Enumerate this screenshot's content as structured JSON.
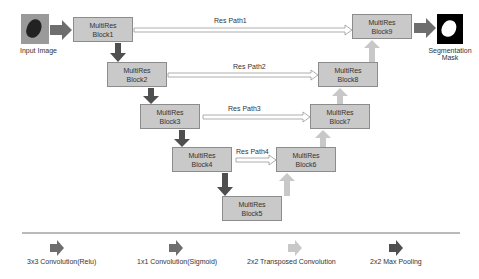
{
  "input": {
    "label": "Input Image"
  },
  "output": {
    "label_line1": "Segmentation",
    "label_line2": "Mask"
  },
  "blocks": [
    {
      "id": "block1",
      "line1": "MultiRes",
      "line2": "Block1"
    },
    {
      "id": "block2",
      "line1": "MultiRes",
      "line2": "Block2"
    },
    {
      "id": "block3",
      "line1": "MultiRes",
      "line2": "Block3"
    },
    {
      "id": "block4",
      "line1": "MultiRes",
      "line2": "Block4"
    },
    {
      "id": "block5",
      "line1": "MultiRes",
      "line2": "Block5"
    },
    {
      "id": "block6",
      "line1": "MultiRes",
      "line2": "Block6"
    },
    {
      "id": "block7",
      "line1": "MultiRes",
      "line2": "Block7"
    },
    {
      "id": "block8",
      "line1": "MultiRes",
      "line2": "Block8"
    },
    {
      "id": "block9",
      "line1": "MultiRes",
      "line2": "Block9"
    }
  ],
  "res_paths": [
    "Res Path1",
    "Res Path2",
    "Res Path3",
    "Res Path4"
  ],
  "legend": [
    {
      "label": "3x3 Convolution(Relu)",
      "color": "#6e6e6e"
    },
    {
      "label": "1x1 Convolution(Sigmoid)",
      "color": "#6e6e6e"
    },
    {
      "label": "2x2 Transposed Convolution",
      "color": "#c8c8c8"
    },
    {
      "label": "2x2 Max Pooling",
      "color": "#4f4f4f"
    }
  ],
  "colors": {
    "block_fill": "#c9c9c9",
    "block_border": "#8c8c8c",
    "conv_arrow": "#6e6e6e",
    "pool_arrow": "#4f4f4f",
    "up_arrow": "#c8c8c8"
  }
}
